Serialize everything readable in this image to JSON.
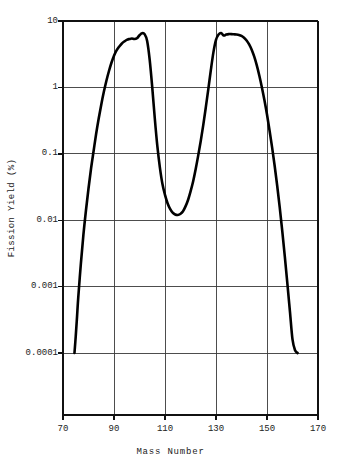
{
  "chart_data": {
    "type": "line",
    "title": "",
    "subtitle": "",
    "xlabel": "Mass Number",
    "ylabel": "Fission Yield (%)",
    "xscale": "linear",
    "yscale": "log",
    "xlim": [
      70,
      170
    ],
    "ylim": [
      0.0001,
      10
    ],
    "grid": true,
    "legend": null,
    "xticks": [
      70,
      90,
      110,
      130,
      150,
      170
    ],
    "xtick_labels": [
      "70",
      "90",
      "110",
      "130",
      "150",
      "170"
    ],
    "yticks": [
      10,
      1,
      0.1,
      0.01,
      0.001,
      0.0001
    ],
    "ytick_labels": [
      "10",
      "1",
      "0.1",
      "0.01",
      "0.001",
      "0.0001"
    ],
    "series": [
      {
        "name": "Fission yield",
        "color": "#000000",
        "x": [
          74.5,
          75.0,
          75.5,
          76.0,
          77.0,
          78.0,
          79.0,
          80.0,
          81.0,
          82.0,
          83.0,
          84.0,
          85.0,
          86.0,
          87.0,
          88.0,
          89.0,
          90.0,
          91.0,
          92.0,
          93.0,
          94.0,
          95.0,
          96.0,
          97.0,
          98.0,
          99.0,
          100.0,
          101.0,
          102.0,
          103.0,
          104.0,
          105.0,
          106.0,
          107.0,
          108.0,
          109.0,
          110.0,
          111.0,
          112.0,
          113.0,
          114.0,
          115.0,
          116.0,
          117.0,
          118.0,
          119.0,
          120.0,
          121.0,
          122.0,
          123.0,
          124.0,
          125.0,
          126.0,
          127.0,
          128.0,
          129.0,
          130.0,
          131.0,
          132.0,
          133.0,
          134.0,
          135.0,
          136.0,
          137.0,
          138.0,
          139.0,
          140.0,
          141.0,
          142.0,
          143.0,
          144.0,
          145.0,
          146.0,
          147.0,
          148.0,
          149.0,
          150.0,
          151.0,
          152.0,
          153.0,
          154.0,
          155.0,
          156.0,
          157.0,
          158.0,
          159.0,
          160.0,
          161.0,
          162.0
        ],
        "y": [
          0.0001,
          0.00018,
          0.00035,
          0.0007,
          0.0022,
          0.006,
          0.014,
          0.03,
          0.06,
          0.11,
          0.2,
          0.34,
          0.55,
          0.85,
          1.25,
          1.75,
          2.35,
          3.0,
          3.6,
          4.1,
          4.55,
          4.9,
          5.2,
          5.35,
          5.45,
          5.35,
          5.5,
          6.1,
          6.55,
          6.35,
          5.0,
          2.6,
          1.0,
          0.34,
          0.13,
          0.062,
          0.035,
          0.024,
          0.018,
          0.0148,
          0.013,
          0.0122,
          0.012,
          0.0124,
          0.0135,
          0.016,
          0.02,
          0.027,
          0.038,
          0.058,
          0.093,
          0.155,
          0.27,
          0.5,
          0.95,
          1.85,
          3.4,
          5.2,
          6.25,
          6.6,
          6.05,
          6.25,
          6.35,
          6.35,
          6.3,
          6.25,
          6.15,
          5.95,
          5.6,
          5.1,
          4.45,
          3.7,
          2.9,
          2.15,
          1.5,
          1.0,
          0.64,
          0.39,
          0.225,
          0.125,
          0.066,
          0.033,
          0.0155,
          0.0068,
          0.0028,
          0.0011,
          0.00042,
          0.00016,
          0.00011,
          0.0001
        ]
      }
    ],
    "annotations": []
  },
  "axes": {
    "y_label": "Fission Yield (%)",
    "x_label": "Mass Number"
  },
  "colors": {
    "curve": "#000000",
    "grid": "#3a3a3a",
    "axis": "#111111",
    "background": "#ffffff",
    "text": "#222222"
  }
}
